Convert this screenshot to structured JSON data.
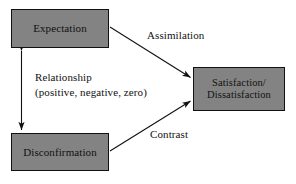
{
  "diagram": {
    "background_color": "#ffffff",
    "node_fill_color": "#838383",
    "node_border_color": "#111111",
    "edge_color": "#111111",
    "nodes": [
      {
        "id": "expectation",
        "label": "Expectation"
      },
      {
        "id": "disconfirmation",
        "label": "Disconfirmation"
      },
      {
        "id": "satisfaction",
        "label_line_1": "Satisfaction/",
        "label_line_2": "Dissatisfaction"
      }
    ],
    "edges": [
      {
        "id": "assimilation",
        "label": "Assimilation",
        "from": "expectation",
        "to": "satisfaction",
        "arrow": "single"
      },
      {
        "id": "contrast",
        "label": "Contrast",
        "from": "disconfirmation",
        "to": "satisfaction",
        "arrow": "single"
      },
      {
        "id": "relationship",
        "label_line_1": "Relationship",
        "label_line_2": "(positive, negative, zero)",
        "from": "expectation",
        "to": "disconfirmation",
        "arrow": "double"
      }
    ]
  }
}
